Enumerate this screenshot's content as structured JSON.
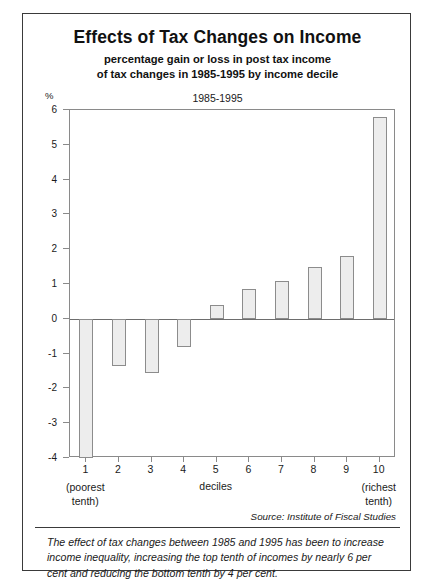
{
  "title": "Effects of Tax Changes on Income",
  "subtitle_line1": "percentage gain or loss in post tax income",
  "subtitle_line2": "of tax changes in 1985-1995 by income decile",
  "series_label": "1985-1995",
  "unit_label": "%",
  "axis_name": "deciles",
  "source": "Source: Institute of Fiscal Studies",
  "footnote": "The effect of tax changes between 1985 and 1995 has been to increase income inequality, increasing the top tenth of incomes by nearly 6 per cent and reducing the bottom tenth by 4 per cent.",
  "x_caption_left_line1": "(poorest",
  "x_caption_left_line2": "tenth)",
  "x_caption_right_line1": "(richest",
  "x_caption_right_line2": "tenth)",
  "colors": {
    "bar_fill": "#ededed",
    "bar_stroke": "#8c8c8c",
    "axis": "#8a8a8a",
    "zero_line": "#6d6d6d",
    "frame": "#3a3a3a",
    "text": "#1a1a1a"
  },
  "chart_data": {
    "type": "bar",
    "title": "Effects of Tax Changes on Income",
    "subtitle": "percentage gain or loss in post tax income of tax changes in 1985-1995 by income decile",
    "xlabel": "deciles",
    "ylabel": "%",
    "series_name": "1985-1995",
    "categories": [
      "1",
      "2",
      "3",
      "4",
      "5",
      "6",
      "7",
      "8",
      "9",
      "10"
    ],
    "values": [
      -4.0,
      -1.35,
      -1.55,
      -0.8,
      0.4,
      0.85,
      1.1,
      1.5,
      1.8,
      5.8
    ],
    "ylim": [
      -4,
      6
    ],
    "yticks": [
      6,
      5,
      4,
      3,
      2,
      1,
      0,
      -1,
      -2,
      -3,
      -4
    ],
    "ytick_labels": [
      "6",
      "5",
      "4",
      "3",
      "2",
      "1",
      "0",
      "-1",
      "-2",
      "-3",
      "-4"
    ],
    "grid": false,
    "legend": "none",
    "annotations": [
      "Source: Institute of Fiscal Studies"
    ]
  }
}
